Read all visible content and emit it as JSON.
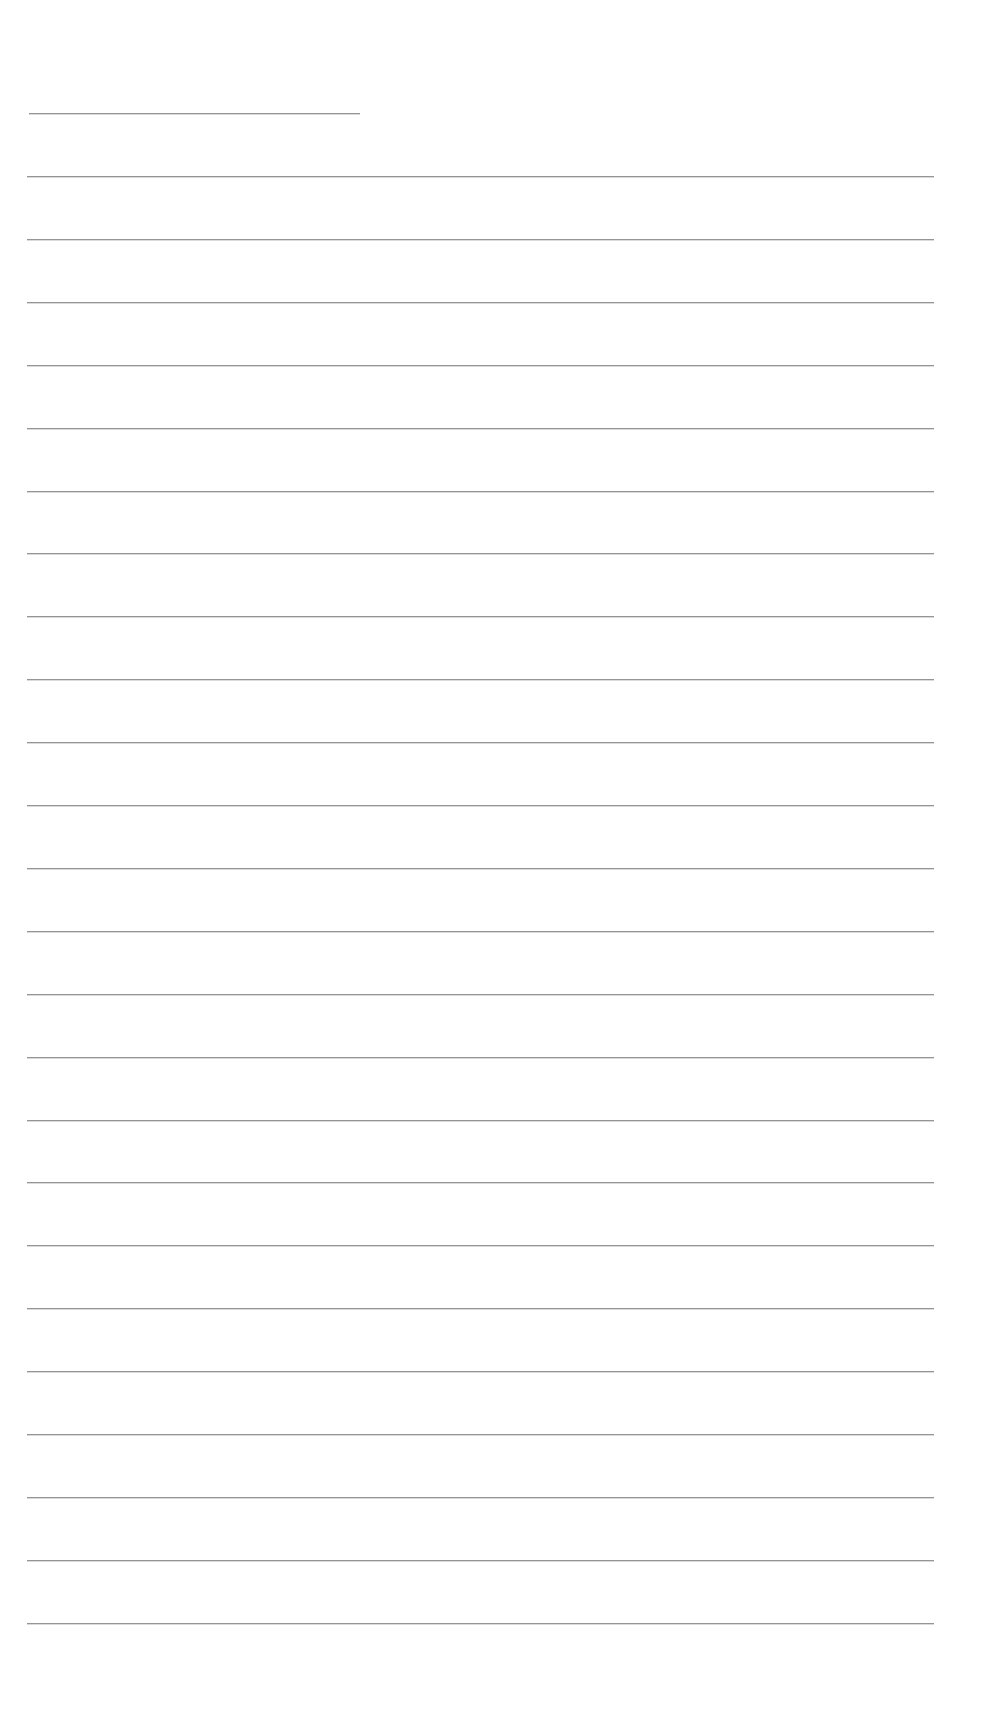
{
  "document": {
    "type": "blank lined page",
    "background_color": "#ffffff",
    "line_color": "#8a8a8a",
    "header_line": {
      "y": 113,
      "x_start": 29,
      "x_end": 360
    },
    "body_lines": {
      "count": 24,
      "first_y": 176,
      "spacing": 62.9,
      "x_start": 27,
      "x_end": 934
    },
    "text_content": []
  }
}
